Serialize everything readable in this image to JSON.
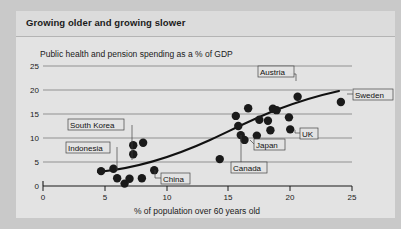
{
  "figure": {
    "title": "Growing older and growing slower",
    "subtitle": "Public health and pension spending as a % of GDP"
  },
  "chart_data": {
    "type": "scatter",
    "title": "Growing older and growing slower",
    "subtitle": "Public health and pension spending as a % of GDP",
    "xlabel": "% of population over 60 years old",
    "ylabel": "Public health and pension spending as a % of GDP",
    "xlim": [
      0,
      25
    ],
    "ylim": [
      0,
      25
    ],
    "xticks": [
      0,
      5,
      10,
      15,
      20,
      25
    ],
    "yticks": [
      0,
      5,
      10,
      15,
      20,
      25
    ],
    "grid": "horizontal",
    "legend": "none",
    "points": [
      {
        "x": 4.7,
        "y": 3.1,
        "label": ""
      },
      {
        "x": 5.7,
        "y": 3.6,
        "label": ""
      },
      {
        "x": 6.0,
        "y": 1.6,
        "label": "Indonesia"
      },
      {
        "x": 6.6,
        "y": 0.5,
        "label": ""
      },
      {
        "x": 7.0,
        "y": 1.5,
        "label": ""
      },
      {
        "x": 7.3,
        "y": 8.5,
        "label": "South Korea"
      },
      {
        "x": 7.3,
        "y": 6.6,
        "label": ""
      },
      {
        "x": 8.1,
        "y": 9.0,
        "label": ""
      },
      {
        "x": 8.0,
        "y": 1.6,
        "label": ""
      },
      {
        "x": 9.0,
        "y": 3.3,
        "label": "China"
      },
      {
        "x": 14.3,
        "y": 5.6,
        "label": ""
      },
      {
        "x": 15.6,
        "y": 14.6,
        "label": ""
      },
      {
        "x": 15.8,
        "y": 12.5,
        "label": ""
      },
      {
        "x": 16.0,
        "y": 10.6,
        "label": "Canada"
      },
      {
        "x": 16.3,
        "y": 9.6,
        "label": "Japan"
      },
      {
        "x": 16.6,
        "y": 16.2,
        "label": ""
      },
      {
        "x": 17.3,
        "y": 10.5,
        "label": ""
      },
      {
        "x": 17.5,
        "y": 13.8,
        "label": ""
      },
      {
        "x": 18.2,
        "y": 13.6,
        "label": ""
      },
      {
        "x": 18.6,
        "y": 16.1,
        "label": ""
      },
      {
        "x": 18.9,
        "y": 15.8,
        "label": ""
      },
      {
        "x": 18.4,
        "y": 11.6,
        "label": ""
      },
      {
        "x": 20.0,
        "y": 11.8,
        "label": "UK"
      },
      {
        "x": 19.9,
        "y": 14.3,
        "label": ""
      },
      {
        "x": 20.6,
        "y": 18.6,
        "label": "Austria"
      },
      {
        "x": 24.1,
        "y": 17.5,
        "label": "Sweden"
      }
    ],
    "trendline": {
      "type": "fitted-curve",
      "x_start": 4.5,
      "x_end": 23.9,
      "description": "upward-sloping fitted trend curve through the scatter"
    },
    "annotations": [
      {
        "label": "Austria",
        "point_x": 20.6,
        "point_y": 18.6
      },
      {
        "label": "Sweden",
        "point_x": 24.1,
        "point_y": 17.5
      },
      {
        "label": "UK",
        "point_x": 20.0,
        "point_y": 11.8
      },
      {
        "label": "Japan",
        "point_x": 16.3,
        "point_y": 9.6
      },
      {
        "label": "Canada",
        "point_x": 16.0,
        "point_y": 10.6
      },
      {
        "label": "China",
        "point_x": 9.0,
        "point_y": 3.3
      },
      {
        "label": "South Korea",
        "point_x": 7.3,
        "point_y": 8.5
      },
      {
        "label": "Indonesia",
        "point_x": 6.0,
        "point_y": 1.6
      }
    ]
  },
  "axes": {
    "y_tick_labels": [
      "0",
      "5",
      "10",
      "15",
      "20",
      "25"
    ],
    "x_tick_labels": [
      "0",
      "5",
      "10",
      "15",
      "20",
      "25"
    ],
    "x_axis_title": "% of population over 60 years old"
  },
  "colors": {
    "outer_background": "#c9c9c9",
    "panel_background": "#e3e3e3",
    "title_bar_background": "#dcdcdc",
    "point": "#1a1a1a",
    "trendline": "#111111",
    "gridline": "#6e6e6e",
    "text": "#1a1a1a"
  }
}
